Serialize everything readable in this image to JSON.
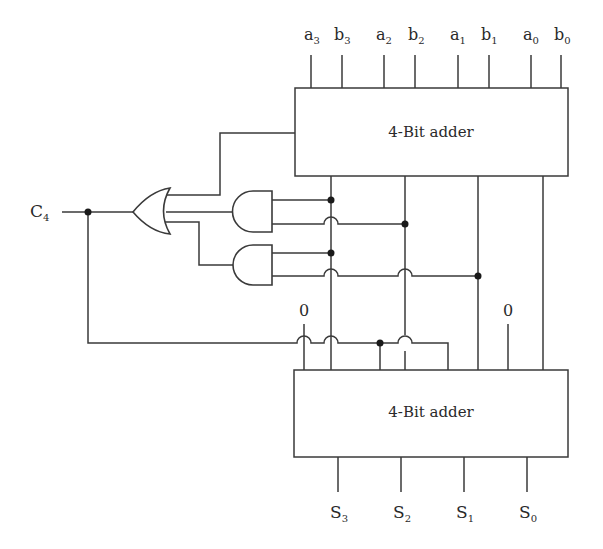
{
  "diagram": {
    "top_adder": {
      "label": "4-Bit adder"
    },
    "bottom_adder": {
      "label": "4-Bit adder"
    },
    "inputs": [
      {
        "base": "a",
        "sub": "3"
      },
      {
        "base": "b",
        "sub": "3"
      },
      {
        "base": "a",
        "sub": "2"
      },
      {
        "base": "b",
        "sub": "2"
      },
      {
        "base": "a",
        "sub": "1"
      },
      {
        "base": "b",
        "sub": "1"
      },
      {
        "base": "a",
        "sub": "0"
      },
      {
        "base": "b",
        "sub": "0"
      }
    ],
    "outputs": [
      {
        "base": "S",
        "sub": "3"
      },
      {
        "base": "S",
        "sub": "2"
      },
      {
        "base": "S",
        "sub": "1"
      },
      {
        "base": "S",
        "sub": "0"
      }
    ],
    "carry_out": {
      "base": "C",
      "sub": "4"
    },
    "constants": {
      "left_zero": "0",
      "right_zero": "0"
    },
    "gates": [
      "OR",
      "AND",
      "AND"
    ],
    "colors": {
      "line": "#3a3a3a",
      "dot": "#1a1a1a",
      "background": "#ffffff"
    }
  }
}
